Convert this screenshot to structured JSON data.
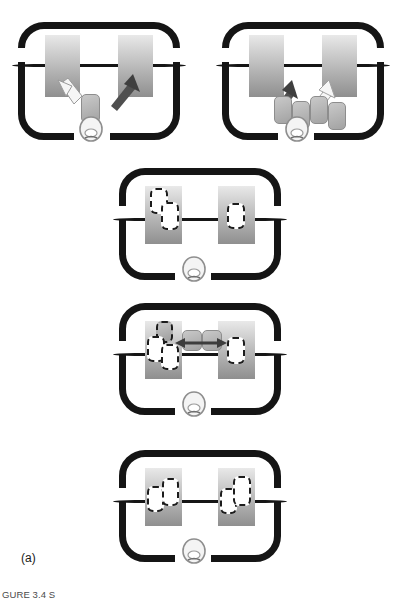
{
  "figure": {
    "sub_label": "(a)",
    "caption": "GURE 3.4  S",
    "colors": {
      "frame": "#151515",
      "block_top": "#e9e9e9",
      "block_bottom": "#8f8f8f",
      "chip_fill": "#b4b4b4",
      "dash_stroke": "#1c1c1c",
      "arrow_light": "#f2f2f2",
      "arrow_dark": "#4a4a4a"
    }
  },
  "panels": [
    {
      "id": "panel-1",
      "name": "panel-top-left",
      "position": "top-left",
      "blocks": [
        {
          "name": "cortical-block-left",
          "items": []
        },
        {
          "name": "cortical-block-right",
          "items": []
        }
      ],
      "chips": [
        {
          "name": "item-chip-center"
        }
      ],
      "arrows": [
        {
          "name": "arrow-to-left-block",
          "style": "light",
          "direction": "up-left"
        },
        {
          "name": "arrow-to-right-block",
          "style": "dark",
          "direction": "up-right"
        }
      ],
      "face": {
        "name": "head-glyph"
      }
    },
    {
      "id": "panel-2",
      "name": "panel-top-right",
      "position": "top-right",
      "blocks": [
        {
          "name": "cortical-block-left",
          "items": []
        },
        {
          "name": "cortical-block-right",
          "items": []
        }
      ],
      "chips": [
        {
          "name": "item-chip-1"
        },
        {
          "name": "item-chip-2"
        },
        {
          "name": "item-chip-3"
        },
        {
          "name": "item-chip-4"
        }
      ],
      "arrows": [
        {
          "name": "arrow-to-left-block",
          "style": "dark",
          "direction": "up-left"
        },
        {
          "name": "arrow-to-right-block",
          "style": "light",
          "direction": "up-right"
        }
      ],
      "face": {
        "name": "head-glyph"
      }
    },
    {
      "id": "panel-3",
      "name": "panel-middle-upper",
      "position": "center-row-2",
      "blocks": [
        {
          "name": "cortical-block-left",
          "items": [
            {
              "name": "dashed-placeholder-1"
            },
            {
              "name": "dashed-placeholder-2"
            }
          ]
        },
        {
          "name": "cortical-block-right",
          "items": [
            {
              "name": "dashed-placeholder-1"
            }
          ]
        }
      ],
      "chips": [],
      "arrows": [],
      "face": {
        "name": "head-glyph"
      }
    },
    {
      "id": "panel-4",
      "name": "panel-middle-lower",
      "position": "center-row-3",
      "blocks": [
        {
          "name": "cortical-block-left",
          "items": [
            {
              "name": "dashed-placeholder-1"
            },
            {
              "name": "dashed-placeholder-2"
            },
            {
              "name": "gray-chip-overlay"
            }
          ]
        },
        {
          "name": "cortical-block-right",
          "items": [
            {
              "name": "dashed-placeholder-1"
            }
          ]
        }
      ],
      "chips": [
        {
          "name": "transfer-chip-left"
        },
        {
          "name": "transfer-chip-right"
        }
      ],
      "arrows": [
        {
          "name": "bidirectional-transfer-arrow",
          "style": "dark",
          "direction": "horizontal-double"
        }
      ],
      "face": {
        "name": "head-glyph"
      }
    },
    {
      "id": "panel-5",
      "name": "panel-bottom",
      "position": "center-row-4",
      "blocks": [
        {
          "name": "cortical-block-left",
          "items": [
            {
              "name": "dashed-placeholder-1"
            },
            {
              "name": "dashed-placeholder-2"
            }
          ]
        },
        {
          "name": "cortical-block-right",
          "items": [
            {
              "name": "dashed-placeholder-1"
            },
            {
              "name": "dashed-placeholder-2"
            }
          ]
        }
      ],
      "chips": [],
      "arrows": [],
      "face": {
        "name": "head-glyph"
      }
    }
  ]
}
